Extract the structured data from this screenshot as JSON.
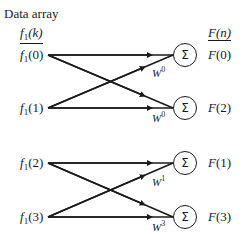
{
  "title": "Data array",
  "input_header": {
    "base": "f",
    "sub": "1",
    "arg": "(k)"
  },
  "output_header": {
    "base": "F",
    "arg": "(n)"
  },
  "inputs": [
    {
      "base": "f",
      "sub": "1",
      "arg": "(0)"
    },
    {
      "base": "f",
      "sub": "1",
      "arg": "(1)"
    },
    {
      "base": "f",
      "sub": "1",
      "arg": "(2)"
    },
    {
      "base": "f",
      "sub": "1",
      "arg": "(3)"
    }
  ],
  "outputs": [
    {
      "base": "F",
      "arg": "(0)"
    },
    {
      "base": "F",
      "arg": "(2)"
    },
    {
      "base": "F",
      "arg": "(1)"
    },
    {
      "base": "F",
      "arg": "(3)"
    }
  ],
  "sum_symbol": "Σ",
  "weights": [
    {
      "base": "W",
      "exp": "0"
    },
    {
      "base": "W",
      "exp": "0"
    },
    {
      "base": "W",
      "exp": "1"
    },
    {
      "base": "W",
      "exp": "3"
    }
  ],
  "colors": {
    "line": "#1a1a1a",
    "background": "#ffffff"
  }
}
